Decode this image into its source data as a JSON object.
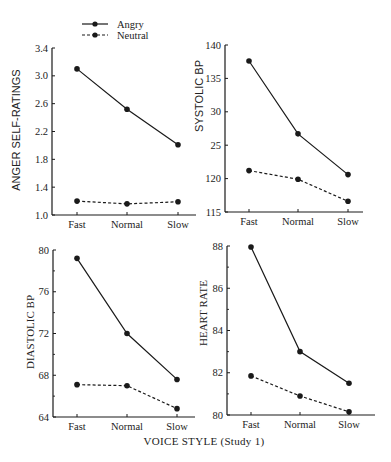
{
  "legend": {
    "items": [
      {
        "label": "Angry",
        "style": "solid"
      },
      {
        "label": "Neutral",
        "style": "dashed"
      }
    ]
  },
  "caption": "VOICE STYLE (Study 1)",
  "colors": {
    "line": "#1a1a1a",
    "background": "#ffffff"
  },
  "chart_data": [
    {
      "type": "line",
      "title": "",
      "xlabel": "",
      "ylabel": "ANGER SELF-RATINGS",
      "categories": [
        "Fast",
        "Normal",
        "Slow"
      ],
      "ylim": [
        1.0,
        3.4
      ],
      "yticks": [
        "1.0",
        "1.4",
        "1.8",
        "2.2",
        "2.6",
        "3.0",
        "3.4"
      ],
      "ytick_values": [
        1.0,
        1.4,
        1.8,
        2.2,
        2.6,
        3.0,
        3.4
      ],
      "minor_ticks": [],
      "grid": false,
      "series": [
        {
          "name": "Angry",
          "values": [
            3.1,
            2.52,
            2.01
          ]
        },
        {
          "name": "Neutral",
          "values": [
            1.2,
            1.16,
            1.19
          ]
        }
      ]
    },
    {
      "type": "line",
      "title": "",
      "xlabel": "",
      "ylabel": "SYSTOLIC BP",
      "categories": [
        "Fast",
        "Normal",
        "Slow"
      ],
      "ylim": [
        115,
        140
      ],
      "yticks": [
        "115",
        "120",
        "25",
        "30",
        "135",
        "140"
      ],
      "ytick_values": [
        115,
        120,
        125,
        130,
        135,
        140
      ],
      "minor_ticks": [],
      "grid": false,
      "series": [
        {
          "name": "Angry",
          "values": [
            137.6,
            126.7,
            120.6
          ]
        },
        {
          "name": "Neutral",
          "values": [
            121.2,
            119.9,
            116.6
          ]
        }
      ]
    },
    {
      "type": "line",
      "title": "",
      "xlabel": "",
      "ylabel": "DIASTOLIC BP",
      "categories": [
        "Fast",
        "Normal",
        "Slow"
      ],
      "ylim": [
        64,
        80
      ],
      "yticks": [
        "64",
        "68",
        "72",
        "76",
        "80"
      ],
      "ytick_values": [
        64,
        68,
        72,
        76,
        80
      ],
      "minor_ticks": [
        66,
        70,
        74,
        78
      ],
      "grid": false,
      "series": [
        {
          "name": "Angry",
          "values": [
            79.2,
            72.0,
            67.6
          ]
        },
        {
          "name": "Neutral",
          "values": [
            67.1,
            67.0,
            64.8
          ]
        }
      ]
    },
    {
      "type": "line",
      "title": "",
      "xlabel": "VOICE STYLE (Study 1)",
      "ylabel": "HEART RATE",
      "categories": [
        "Fast",
        "Normal",
        "Slow"
      ],
      "ylim": [
        80,
        88
      ],
      "yticks": [
        "80",
        "82",
        "84",
        "86",
        "88"
      ],
      "ytick_values": [
        80,
        82,
        84,
        86,
        88
      ],
      "minor_ticks": [
        81,
        83,
        85,
        87
      ],
      "grid": false,
      "series": [
        {
          "name": "Angry",
          "values": [
            87.95,
            83.0,
            81.5
          ]
        },
        {
          "name": "Neutral",
          "values": [
            81.85,
            80.9,
            80.15
          ]
        }
      ]
    }
  ]
}
